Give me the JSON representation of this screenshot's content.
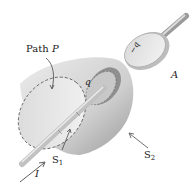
{
  "diagram": {
    "type": "physics-illustration",
    "labels": {
      "path": "Path",
      "path_var": "P",
      "plate_positive": "q",
      "plate_negative": "−q",
      "plate_a": "A",
      "surface1": "S",
      "surface1_sub": "1",
      "surface2": "S",
      "surface2_sub": "2",
      "current": "I"
    },
    "colors": {
      "surface_fill": "#d9d9d9",
      "surface_dark": "#a8a8a8",
      "disc_fill": "#e6e6e6",
      "wire": "#bdbdbd",
      "dashed_line": "#555555",
      "text": "#222222"
    }
  }
}
